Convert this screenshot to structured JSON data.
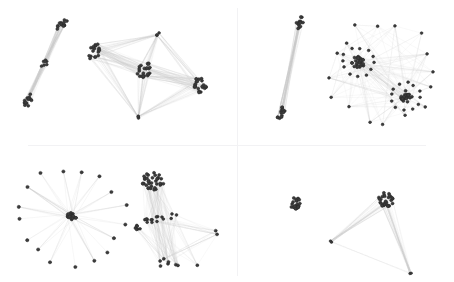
{
  "figure": {
    "title": "",
    "width": 454,
    "height": 282,
    "background_color": "#ffffff",
    "node_color": "#3c3c3c",
    "node_edge_color": "#2a2a2a",
    "edge_color": "#c9c9c9",
    "edge_color_light": "#dcdcdc",
    "divider_color": "#f2f2f4",
    "layout": "2x2-grid-of-graph-drawings"
  },
  "dividers": {
    "horizontal": {
      "x": 28,
      "y": 145,
      "length": 398,
      "orientation": "horizontal"
    },
    "vertical": {
      "x": 237,
      "y": 8,
      "length": 268,
      "orientation": "vertical"
    }
  },
  "chart_data": {
    "type": "scatter",
    "title": "",
    "xlabel": "",
    "ylabel": "",
    "grid": false,
    "legend": null,
    "xlim": [
      0,
      454
    ],
    "ylim": [
      0,
      282
    ],
    "panels": [
      {
        "panel_id": "top-left",
        "bounds": [
          0,
          0,
          237,
          145
        ],
        "graphs": [
          {
            "graph_id": "tl-barbell",
            "kind": "barbell",
            "node_groups": [
              {
                "group_id": "tl-bb-end-top",
                "cx": 62,
                "cy": 25,
                "rx": 8,
                "ry": 4,
                "rot": -58,
                "count": 14,
                "radius": 1.5
              },
              {
                "group_id": "tl-bb-mid",
                "cx": 45,
                "cy": 63,
                "rx": 6,
                "ry": 3,
                "rot": -58,
                "count": 7,
                "radius": 1.4
              },
              {
                "group_id": "tl-bb-end-bottom",
                "cx": 28,
                "cy": 101,
                "rx": 8,
                "ry": 4,
                "rot": -58,
                "count": 14,
                "radius": 1.5
              }
            ],
            "bundles": [
              {
                "from": "tl-bb-end-top",
                "to": "tl-bb-mid",
                "count": 46,
                "width": 0.5
              },
              {
                "from": "tl-bb-mid",
                "to": "tl-bb-end-bottom",
                "count": 46,
                "width": 0.5
              }
            ]
          },
          {
            "graph_id": "tl-triangulated",
            "kind": "multi-cluster-mesh",
            "node_groups": [
              {
                "group_id": "tl-c-left",
                "cx": 94,
                "cy": 51,
                "rx": 6,
                "ry": 9,
                "rot": 20,
                "count": 18,
                "radius": 1.5
              },
              {
                "group_id": "tl-c-center",
                "cx": 144,
                "cy": 70,
                "rx": 7,
                "ry": 9,
                "rot": 10,
                "count": 24,
                "radius": 1.5
              },
              {
                "group_id": "tl-c-right",
                "cx": 200,
                "cy": 84,
                "rx": 7,
                "ry": 9,
                "rot": 12,
                "count": 22,
                "radius": 1.5
              },
              {
                "group_id": "tl-n-top",
                "cx": 158,
                "cy": 34,
                "rx": 2.5,
                "ry": 2,
                "rot": 0,
                "count": 3,
                "radius": 1.4
              },
              {
                "group_id": "tl-n-bottom",
                "cx": 137,
                "cy": 117,
                "rx": 2.5,
                "ry": 2,
                "rot": 0,
                "count": 3,
                "radius": 1.4
              }
            ],
            "bundles": [
              {
                "from": "tl-c-left",
                "to": "tl-c-center",
                "count": 40,
                "width": 0.5
              },
              {
                "from": "tl-c-center",
                "to": "tl-c-right",
                "count": 40,
                "width": 0.5
              },
              {
                "from": "tl-c-left",
                "to": "tl-n-top",
                "count": 20,
                "width": 0.4
              },
              {
                "from": "tl-c-left",
                "to": "tl-n-bottom",
                "count": 20,
                "width": 0.4
              },
              {
                "from": "tl-c-center",
                "to": "tl-n-top",
                "count": 22,
                "width": 0.4
              },
              {
                "from": "tl-c-center",
                "to": "tl-n-bottom",
                "count": 22,
                "width": 0.4
              },
              {
                "from": "tl-c-right",
                "to": "tl-n-top",
                "count": 20,
                "width": 0.4
              },
              {
                "from": "tl-c-right",
                "to": "tl-n-bottom",
                "count": 20,
                "width": 0.4
              },
              {
                "from": "tl-c-left",
                "to": "tl-c-right",
                "count": 14,
                "width": 0.35
              }
            ]
          }
        ]
      },
      {
        "panel_id": "top-right",
        "bounds": [
          237,
          0,
          454,
          145
        ],
        "graphs": [
          {
            "graph_id": "tr-rod",
            "kind": "barbell",
            "node_groups": [
              {
                "group_id": "tr-rod-top",
                "cx": 300,
                "cy": 22,
                "rx": 7,
                "ry": 3.5,
                "rot": -72,
                "count": 13,
                "radius": 1.5
              },
              {
                "group_id": "tr-rod-bottom",
                "cx": 281,
                "cy": 112,
                "rx": 7,
                "ry": 3.5,
                "rot": -72,
                "count": 13,
                "radius": 1.5
              }
            ],
            "bundles": [
              {
                "from": "tr-rod-top",
                "to": "tr-rod-bottom",
                "count": 44,
                "width": 0.5
              }
            ]
          },
          {
            "graph_id": "tr-dense-mesh",
            "kind": "dense-mesh",
            "node_groups": [
              {
                "group_id": "tr-hub-a",
                "cx": 358,
                "cy": 62,
                "rx": 7,
                "ry": 6,
                "rot": 0,
                "count": 30,
                "radius": 1.5
              },
              {
                "group_id": "tr-hub-b",
                "cx": 406,
                "cy": 96,
                "rx": 6,
                "ry": 6,
                "rot": 0,
                "count": 26,
                "radius": 1.5
              },
              {
                "group_id": "tr-ring-a",
                "cx": 358,
                "cy": 62,
                "rx": 17,
                "ry": 15,
                "rot": 0,
                "count": 12,
                "radius": 1.4
              },
              {
                "group_id": "tr-ring-b",
                "cx": 406,
                "cy": 96,
                "rx": 16,
                "ry": 14,
                "rot": 0,
                "count": 12,
                "radius": 1.4
              },
              {
                "group_id": "tr-frame",
                "cx": 383,
                "cy": 73,
                "rx": 54,
                "ry": 53,
                "rot": 14,
                "count": 16,
                "radius": 1.4
              }
            ],
            "bundles": [
              {
                "from": "tr-hub-a",
                "to": "tr-frame",
                "count": 60,
                "width": 0.35
              },
              {
                "from": "tr-hub-b",
                "to": "tr-frame",
                "count": 60,
                "width": 0.35
              },
              {
                "from": "tr-hub-a",
                "to": "tr-hub-b",
                "count": 28,
                "width": 0.35
              },
              {
                "from": "tr-frame",
                "to": "tr-frame",
                "count": 40,
                "width": 0.35
              },
              {
                "from": "tr-ring-a",
                "to": "tr-hub-a",
                "count": 18,
                "width": 0.35
              },
              {
                "from": "tr-ring-b",
                "to": "tr-hub-b",
                "count": 18,
                "width": 0.35
              }
            ]
          }
        ]
      },
      {
        "panel_id": "bottom-left",
        "bounds": [
          0,
          145,
          237,
          282
        ],
        "graphs": [
          {
            "graph_id": "bl-star",
            "kind": "star",
            "node_groups": [
              {
                "group_id": "bl-star-hub",
                "cx": 72,
                "cy": 216,
                "rx": 5,
                "ry": 4,
                "rot": 0,
                "count": 22,
                "radius": 1.5
              },
              {
                "group_id": "bl-star-leaves",
                "cx": 72,
                "cy": 216,
                "rx": 54,
                "ry": 48,
                "rot": 0,
                "count": 17,
                "radius": 1.6
              }
            ],
            "bundles": [
              {
                "from": "bl-star-hub",
                "to": "bl-star-leaves",
                "count": 68,
                "width": 0.45
              }
            ]
          },
          {
            "graph_id": "bl-cone",
            "kind": "cone-cluster",
            "node_groups": [
              {
                "group_id": "bl-cone-top",
                "cx": 153,
                "cy": 181,
                "rx": 11,
                "ry": 9,
                "rot": 0,
                "count": 36,
                "radius": 1.5
              },
              {
                "group_id": "bl-cone-chain",
                "cx": 163,
                "cy": 218,
                "rx": 22,
                "ry": 4,
                "rot": -8,
                "count": 16,
                "radius": 1.4
              },
              {
                "group_id": "bl-cone-left",
                "cx": 137,
                "cy": 227,
                "rx": 5,
                "ry": 2.5,
                "rot": 0,
                "count": 7,
                "radius": 1.4
              },
              {
                "group_id": "bl-cone-base",
                "cx": 178,
                "cy": 264,
                "rx": 21,
                "ry": 6,
                "rot": 4,
                "count": 8,
                "radius": 1.5
              },
              {
                "group_id": "bl-cone-right",
                "cx": 216,
                "cy": 233,
                "rx": 3,
                "ry": 3,
                "rot": 0,
                "count": 2,
                "radius": 1.5
              }
            ],
            "bundles": [
              {
                "from": "bl-cone-top",
                "to": "bl-cone-base",
                "count": 44,
                "width": 0.45
              },
              {
                "from": "bl-cone-top",
                "to": "bl-cone-chain",
                "count": 26,
                "width": 0.4
              },
              {
                "from": "bl-cone-chain",
                "to": "bl-cone-base",
                "count": 26,
                "width": 0.4
              },
              {
                "from": "bl-cone-chain",
                "to": "bl-cone-right",
                "count": 16,
                "width": 0.35
              },
              {
                "from": "bl-cone-left",
                "to": "bl-cone-base",
                "count": 14,
                "width": 0.35
              },
              {
                "from": "bl-cone-right",
                "to": "bl-cone-base",
                "count": 12,
                "width": 0.35
              }
            ]
          }
        ]
      },
      {
        "panel_id": "bottom-right",
        "bounds": [
          237,
          145,
          454,
          282
        ],
        "graphs": [
          {
            "graph_id": "br-isolated",
            "kind": "isolated-cluster",
            "node_groups": [
              {
                "group_id": "br-blob",
                "cx": 295,
                "cy": 203,
                "rx": 6,
                "ry": 6,
                "rot": 0,
                "count": 24,
                "radius": 1.5
              }
            ],
            "bundles": []
          },
          {
            "graph_id": "br-wedge",
            "kind": "wedge",
            "node_groups": [
              {
                "group_id": "br-wedge-hub",
                "cx": 387,
                "cy": 200,
                "rx": 9,
                "ry": 9,
                "rot": 0,
                "count": 30,
                "radius": 1.5
              },
              {
                "group_id": "br-wedge-left",
                "cx": 330,
                "cy": 242,
                "rx": 2,
                "ry": 2,
                "rot": 0,
                "count": 2,
                "radius": 1.3
              },
              {
                "group_id": "br-wedge-bottom",
                "cx": 410,
                "cy": 272,
                "rx": 2,
                "ry": 2,
                "rot": 0,
                "count": 2,
                "radius": 1.3
              }
            ],
            "bundles": [
              {
                "from": "br-wedge-hub",
                "to": "br-wedge-left",
                "count": 30,
                "width": 0.4
              },
              {
                "from": "br-wedge-hub",
                "to": "br-wedge-bottom",
                "count": 30,
                "width": 0.4
              },
              {
                "from": "br-wedge-left",
                "to": "br-wedge-bottom",
                "count": 4,
                "width": 0.3
              }
            ]
          }
        ]
      }
    ]
  }
}
